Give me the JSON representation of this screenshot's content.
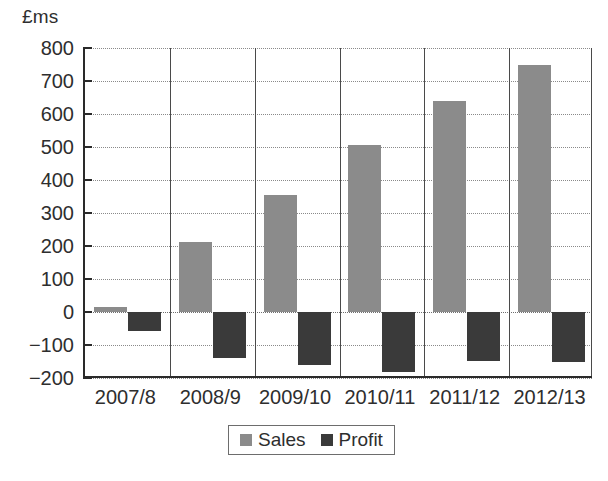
{
  "chart_data": {
    "type": "bar",
    "title": "",
    "subtitle": "",
    "xlabel": "",
    "ylabel": "£ms",
    "ylim": [
      -200,
      800
    ],
    "ytick_step": 100,
    "yticks": [
      800,
      700,
      600,
      500,
      400,
      300,
      200,
      100,
      0,
      -100,
      -200
    ],
    "ytick_labels": [
      "800",
      "700",
      "600",
      "500",
      "400",
      "300",
      "200",
      "100",
      "0",
      "-100",
      "-200"
    ],
    "categories": [
      "2007/8",
      "2008/9",
      "2009/10",
      "2010/11",
      "2011/12",
      "2012/13"
    ],
    "series": [
      {
        "name": "Sales",
        "color": "#8b8b8b",
        "values": [
          15,
          212,
          355,
          505,
          638,
          750
        ]
      },
      {
        "name": "Profit",
        "color": "#3a3a3a",
        "values": [
          -58,
          -138,
          -160,
          -183,
          -148,
          -152
        ]
      }
    ],
    "grid": {
      "horizontal": true,
      "horizontal_style": "dotted",
      "vertical": true,
      "vertical_style": "solid"
    },
    "legend": {
      "position": "bottom-center",
      "boxed": true,
      "entries": [
        {
          "label": "Sales",
          "color": "#8b8b8b",
          "swatch": "sales-swatch"
        },
        {
          "label": "Profit",
          "color": "#3a3a3a",
          "swatch": "profit-swatch"
        }
      ]
    },
    "axis_color": "#2a2a2a",
    "background": "#ffffff"
  }
}
